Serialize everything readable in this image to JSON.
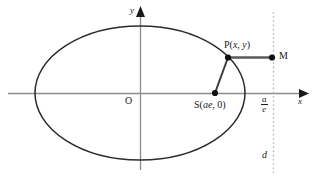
{
  "figure": {
    "background_color": "#ffffff",
    "ink_color": "#1a1a1a",
    "axis_color": "#8c8c8c",
    "dash_color": "#b0b0b0",
    "curve_color": "#2b2b2b",
    "segment_color": "#4a4a4a"
  },
  "axes": {
    "x_label": "x",
    "y_label": "y",
    "origin_label": "O"
  },
  "points": {
    "p_label": "P(",
    "p_label_x": "x",
    "p_label_sep": ", ",
    "p_label_y": "y",
    "p_label_close": ")",
    "m_label": "M",
    "s_label_open": "S(",
    "s_label_val": "ae",
    "s_label_rest": ", 0)"
  },
  "directrix": {
    "fraction_numerator": "a",
    "fraction_denominator": "e",
    "bottom_label": "d"
  },
  "geometry": {
    "ellipse_center_x": 140,
    "ellipse_center_y": 93,
    "ellipse_semi_major": 105,
    "ellipse_semi_minor": 67,
    "focus_x": 215,
    "focus_y": 93,
    "point_p_x": 228,
    "point_p_y": 57,
    "point_m_x": 272,
    "point_m_y": 57,
    "directrix_x": 273,
    "x_axis_y": 93,
    "y_axis_x": 140
  }
}
